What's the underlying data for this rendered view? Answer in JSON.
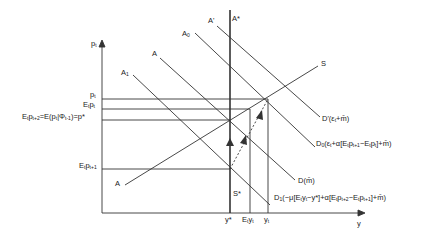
{
  "diagram": {
    "axes": {
      "y_label": "p",
      "y_label_sub": "t",
      "x_label": "y"
    },
    "price_levels": [
      {
        "id": "p_t",
        "main": "p",
        "sub": "t",
        "text": "p_t"
      },
      {
        "id": "Et_pt",
        "text": "E_t p_t"
      },
      {
        "id": "p_star",
        "text": "E_t p_{t+2} = E(p_t | Φ_{t-1}) = p*"
      },
      {
        "id": "Et_pt1",
        "text": "E_t p_{t+1}"
      }
    ],
    "output_levels": [
      {
        "id": "y_star",
        "text": "y*"
      },
      {
        "id": "Et_yt",
        "text": "E_t y_t"
      },
      {
        "id": "y_t",
        "text": "y_t"
      }
    ],
    "curves": {
      "A_star": "A*",
      "A_prime": "A'",
      "A0": "A0",
      "A": "A",
      "A1": "A1",
      "S": "S",
      "S_star": "S*",
      "A_lower": "A",
      "D_prime": "D'(ε_t + m̄)",
      "D0": "D0(ε_t + α[E_t p_{t+1} − E_t p_t] + m̄)",
      "D": "D(m̄)",
      "D1": "D1(−μ[E_t y_t − y*] + α[E_t p_{t+2} − E_t p_{t+1}] + m̄)"
    },
    "labels": {
      "A_star": "A*",
      "A_prime": "A'",
      "A0_main": "A",
      "A0_sub": "0",
      "A_main": "A",
      "A1_main": "A",
      "A1_sub": "1",
      "S": "S",
      "S_star": "S*",
      "A_lower": "A",
      "y_axis_main": "p",
      "y_axis_sub": "t",
      "x_axis": "y",
      "pt_main": "p",
      "pt_sub": "t",
      "Etpt_E": "E",
      "Etpt_sub1": "t",
      "Etpt_p": "p",
      "Etpt_sub2": "t",
      "pstar_a": "E",
      "pstar_b": "t",
      "pstar_c": "p",
      "pstar_d": "t+2",
      "pstar_e": "=E(p",
      "pstar_f": "t",
      "pstar_g": "|Φ",
      "pstar_h": "t-1",
      "pstar_i": ")=p*",
      "Etpt1_E": "E",
      "Etpt1_s1": "t",
      "Etpt1_p": "p",
      "Etpt1_s2": "t+1",
      "ystar": "y*",
      "Etyt_E": "E",
      "Etyt_s1": "t",
      "Etyt_y": "y",
      "Etyt_s2": "t",
      "yt_main": "y",
      "yt_sub": "t",
      "Dprime_main": "D'(ε",
      "Dprime_sub": "t",
      "Dprime_rest": "+m̄)",
      "D0_main": "D",
      "D0_sub": "0",
      "D0_a": "(ε",
      "D0_b": "t",
      "D0_c": "+α[E",
      "D0_d": "t",
      "D0_e": "p",
      "D0_f": "t+1",
      "D0_g": "−E",
      "D0_h": "t",
      "D0_i": "p",
      "D0_j": "t",
      "D0_k": "]+m̄)",
      "D_text": "D(m̄)",
      "D1_main": "D",
      "D1_sub": "1",
      "D1_a": "(−μ[E",
      "D1_b": "t",
      "D1_c": "y",
      "D1_d": "t",
      "D1_e": "−y*]+α[E",
      "D1_f": "t",
      "D1_g": "p",
      "D1_h": "t+2",
      "D1_i": "−E",
      "D1_j": "t",
      "D1_k": "p",
      "D1_l": "t+1",
      "D1_m": "]+m̄)"
    },
    "colors": {
      "line": "#333333",
      "background": "#ffffff"
    }
  }
}
